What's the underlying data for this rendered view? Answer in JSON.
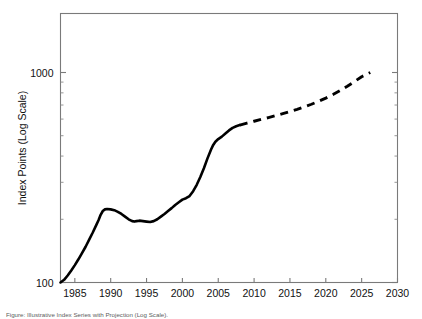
{
  "figure": {
    "caption": "Figure: Illustrative Index Series with Projection (Log Scale)."
  },
  "chart_data": {
    "type": "line",
    "title": "",
    "xlabel": "",
    "ylabel": "Index Points (Log Scale)",
    "yscale": "log",
    "xlim": [
      1983,
      2030
    ],
    "ylim": [
      100,
      1600
    ],
    "grid": false,
    "legend": null,
    "xticks": [
      1985,
      1990,
      1995,
      2000,
      2005,
      2010,
      2015,
      2020,
      2025,
      2030
    ],
    "xtick_labels": [
      "1985",
      "1990",
      "1995",
      "2000",
      "2005",
      "2010",
      "2015",
      "2020",
      "2025",
      "2030"
    ],
    "yticks": [
      100,
      1000
    ],
    "ytick_labels": [
      "100",
      "1000"
    ],
    "yminor_ticks": [
      200,
      300,
      400,
      500,
      600,
      700,
      800,
      900,
      2000,
      3000,
      4000,
      5000
    ],
    "series": [
      {
        "name": "historical",
        "style": "solid",
        "color": "#000000",
        "x": [
          1983.0,
          1983.5,
          1984.0,
          1984.5,
          1985.0,
          1985.5,
          1986.0,
          1986.5,
          1987.0,
          1987.5,
          1988.0,
          1988.3,
          1988.6,
          1988.9,
          1989.2,
          1989.5,
          1990.0,
          1990.5,
          1991.0,
          1991.5,
          1992.0,
          1992.5,
          1993.0,
          1993.3,
          1993.6,
          1994.0,
          1994.5,
          1995.0,
          1995.5,
          1996.0,
          1996.5,
          1997.0,
          1997.5,
          1998.0,
          1998.5,
          1999.0,
          1999.5,
          2000.0,
          2000.5,
          2001.0,
          2001.5,
          2002.0,
          2002.5,
          2003.0,
          2003.5,
          2004.0,
          2004.3,
          2004.6,
          2005.0,
          2005.5,
          2006.0,
          2006.5,
          2007.0,
          2007.5,
          2008.0
        ],
        "y": [
          100,
          103,
          108,
          114,
          121,
          129,
          138,
          148,
          160,
          173,
          188,
          198,
          210,
          219,
          223,
          224,
          223,
          221,
          217,
          212,
          206,
          200,
          196,
          195,
          196,
          197,
          196,
          195,
          194,
          196,
          200,
          206,
          212,
          219,
          226,
          234,
          241,
          248,
          252,
          258,
          272,
          292,
          318,
          350,
          390,
          430,
          452,
          468,
          482,
          495,
          512,
          530,
          545,
          555,
          562
        ]
      },
      {
        "name": "projection",
        "style": "dashed",
        "color": "#000000",
        "x": [
          2008.0,
          2009,
          2010,
          2011,
          2012,
          2013,
          2014,
          2015,
          2016,
          2017,
          2018,
          2019,
          2020,
          2021,
          2022,
          2023,
          2024,
          2025,
          2026.2
        ],
        "y": [
          562,
          574,
          586,
          598,
          610,
          623,
          637,
          652,
          668,
          686,
          706,
          729,
          755,
          785,
          820,
          860,
          905,
          955,
          1000
        ]
      }
    ]
  }
}
